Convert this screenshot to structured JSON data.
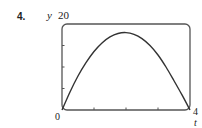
{
  "problem": {
    "number": "4."
  },
  "axes": {
    "y_label": "y",
    "y_max_label": "20",
    "origin_label": "0",
    "x_max_label": "4",
    "x_label": "t"
  },
  "colors": {
    "curve": "#333333",
    "frame": "#555555",
    "background": "#ffffff"
  },
  "chart_data": {
    "type": "line",
    "title": "",
    "xlabel": "t",
    "ylabel": "y",
    "xlim": [
      0,
      4
    ],
    "ylim": [
      0,
      20
    ],
    "x_ticks": [
      0,
      1,
      2,
      3,
      4
    ],
    "y_ticks": [
      0,
      5,
      10,
      15,
      20
    ],
    "tick_labels_shown": {
      "x": [
        "0",
        "4"
      ],
      "y": [
        "20"
      ]
    },
    "grid": false,
    "legend": null,
    "frame": "rounded-rectangle viewing window",
    "series": [
      {
        "name": "y(t)",
        "x": [
          0,
          0.25,
          0.5,
          0.75,
          1.0,
          1.25,
          1.5,
          1.75,
          2.0,
          2.25,
          2.5,
          2.75,
          3.0,
          3.25,
          3.5,
          3.75,
          4.0
        ],
        "values": [
          0,
          4.2,
          7.9,
          11.0,
          13.6,
          15.6,
          17.0,
          17.8,
          18.0,
          17.6,
          16.6,
          15.0,
          12.8,
          10.0,
          6.8,
          3.5,
          0
        ]
      }
    ]
  }
}
